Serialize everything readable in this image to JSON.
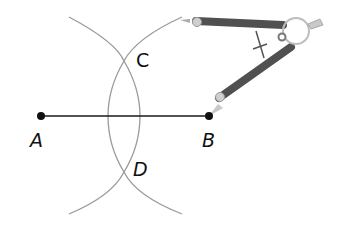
{
  "diagram": {
    "points": [
      {
        "id": "A",
        "label": "A",
        "x": 41,
        "y": 116
      },
      {
        "id": "B",
        "label": "B",
        "x": 209,
        "y": 116
      },
      {
        "id": "C",
        "label": "C",
        "x": 124,
        "y": 61
      },
      {
        "id": "D",
        "label": "D",
        "x": 124,
        "y": 172
      }
    ],
    "segment": {
      "from": "A",
      "to": "B"
    },
    "arcs": [
      {
        "center": "B",
        "passes_through": [
          "C",
          "D"
        ]
      },
      {
        "center": "A",
        "passes_through": [
          "C",
          "D"
        ]
      }
    ],
    "tool": "compass",
    "colors": {
      "line": "#1a1a1a",
      "arc": "#9a9a9a",
      "compass_arm": "#555555",
      "point": "#111111"
    }
  }
}
